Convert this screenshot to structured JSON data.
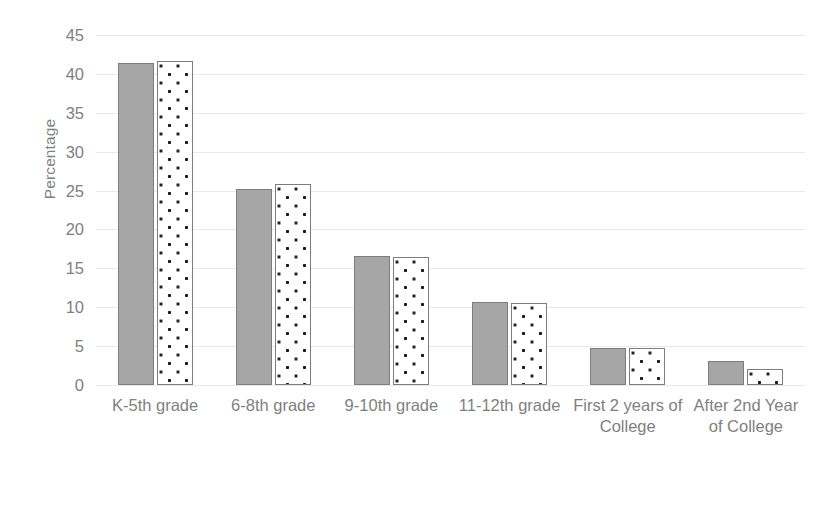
{
  "chart_data": {
    "type": "bar",
    "title": "",
    "xlabel": "",
    "ylabel": "Percentage",
    "ylim": [
      0,
      45
    ],
    "ytick_step": 5,
    "yticks": [
      45,
      40,
      35,
      30,
      25,
      20,
      15,
      10,
      5,
      0
    ],
    "grid": true,
    "legend": "none",
    "categories": [
      "K-5th grade",
      "6-8th grade",
      "9-10th grade",
      "11-12th grade",
      "First 2 years of College",
      "After 2nd Year of College"
    ],
    "series": [
      {
        "name": "Series 1",
        "style": "solid-gray",
        "color": "#a6a6a6",
        "values": [
          41.4,
          25.2,
          16.6,
          10.7,
          4.7,
          3.1
        ]
      },
      {
        "name": "Series 2",
        "style": "white-dotted-pattern",
        "color": "#ffffff",
        "pattern_color": "#1a1a1a",
        "values": [
          41.6,
          25.9,
          16.4,
          10.5,
          4.7,
          2.0
        ]
      }
    ]
  },
  "colors": {
    "gridline": "#e9e9e9",
    "text": "#7f7f7f",
    "bar_outline": "#7d7d7d",
    "background": "#ffffff"
  }
}
